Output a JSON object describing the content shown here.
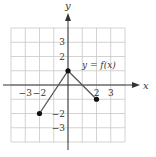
{
  "chart_data": {
    "type": "line",
    "title": "",
    "xlabel": "x",
    "ylabel": "y",
    "function_label": "y = f(x)",
    "xlim": [
      -4,
      4
    ],
    "ylim": [
      -4,
      4
    ],
    "grid": true,
    "x_tick_labels": [
      {
        "value": -3,
        "label": "−3"
      },
      {
        "value": -2,
        "label": "−2"
      },
      {
        "value": 2,
        "label": "2"
      },
      {
        "value": 3,
        "label": "3"
      }
    ],
    "y_tick_labels": [
      {
        "value": 3,
        "label": "3"
      },
      {
        "value": 2,
        "label": "2"
      },
      {
        "value": -2,
        "label": "−2"
      },
      {
        "value": -3,
        "label": "−3"
      }
    ],
    "series": [
      {
        "name": "f(x)",
        "points": [
          {
            "x": -2,
            "y": -2,
            "endpoint": "closed"
          },
          {
            "x": 0,
            "y": 1,
            "endpoint": "closed"
          },
          {
            "x": 2,
            "y": -1,
            "endpoint": "closed"
          }
        ]
      }
    ]
  },
  "colors": {
    "grid": "#c8c8c8",
    "axis": "#333333",
    "curve": "#555555",
    "point": "#111111"
  }
}
